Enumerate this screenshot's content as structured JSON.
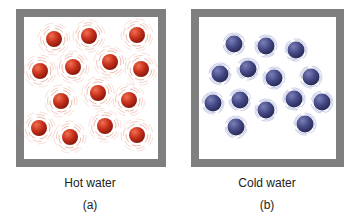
{
  "panels": [
    {
      "id": "a",
      "caption": "Hot water",
      "letter": "(a)",
      "molecule_color": "#c8301c",
      "motion_ring_color": "#e08a70",
      "molecules": [
        [
          54,
          39
        ],
        [
          89,
          36
        ],
        [
          137,
          35
        ],
        [
          40,
          71
        ],
        [
          73,
          67
        ],
        [
          110,
          62
        ],
        [
          141,
          69
        ],
        [
          61,
          101
        ],
        [
          98,
          93
        ],
        [
          129,
          100
        ],
        [
          39,
          128
        ],
        [
          70,
          137
        ],
        [
          105,
          126
        ],
        [
          137,
          135
        ]
      ]
    },
    {
      "id": "b",
      "caption": "Cold water",
      "letter": "(b)",
      "molecule_color": "#464a86",
      "motion_ring_color": "#a8b0d8",
      "molecules": [
        [
          234,
          44
        ],
        [
          266,
          46
        ],
        [
          296,
          50
        ],
        [
          220,
          74
        ],
        [
          248,
          69
        ],
        [
          274,
          78
        ],
        [
          311,
          77
        ],
        [
          213,
          103
        ],
        [
          240,
          100
        ],
        [
          266,
          110
        ],
        [
          294,
          99
        ],
        [
          322,
          102
        ],
        [
          236,
          127
        ],
        [
          305,
          124
        ]
      ]
    }
  ]
}
